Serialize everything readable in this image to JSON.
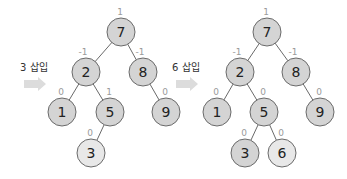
{
  "colors": {
    "node_fill": "#d4d4d4",
    "node_fill_new": "#e8e8e8",
    "node_stroke": "#6a6a6a",
    "edge": "#6a6a6a",
    "bf_text": "#9a9a9a",
    "arrow": "#dcdcdc"
  },
  "panels": [
    {
      "step_label": "3 삽입",
      "nodes": [
        {
          "value": "7",
          "bf": "1",
          "x": 121,
          "y": 32,
          "new": false
        },
        {
          "value": "2",
          "bf": "-1",
          "x": 86,
          "y": 72,
          "new": false
        },
        {
          "value": "8",
          "bf": "-1",
          "x": 143,
          "y": 72,
          "new": false
        },
        {
          "value": "1",
          "bf": "0",
          "x": 62,
          "y": 112,
          "new": false
        },
        {
          "value": "5",
          "bf": "1",
          "x": 110,
          "y": 112,
          "new": false
        },
        {
          "value": "9",
          "bf": "0",
          "x": 166,
          "y": 112,
          "new": false
        },
        {
          "value": "3",
          "bf": "0",
          "x": 91,
          "y": 153,
          "new": true
        }
      ],
      "edges": [
        [
          0,
          1
        ],
        [
          0,
          2
        ],
        [
          1,
          3
        ],
        [
          1,
          4
        ],
        [
          2,
          5
        ],
        [
          4,
          6
        ]
      ]
    },
    {
      "step_label": "6 삽입",
      "nodes": [
        {
          "value": "7",
          "bf": "1",
          "x": 267,
          "y": 32,
          "new": false
        },
        {
          "value": "2",
          "bf": "-1",
          "x": 240,
          "y": 72,
          "new": false
        },
        {
          "value": "8",
          "bf": "-1",
          "x": 296,
          "y": 72,
          "new": false
        },
        {
          "value": "1",
          "bf": "0",
          "x": 217,
          "y": 112,
          "new": false
        },
        {
          "value": "5",
          "bf": "0",
          "x": 264,
          "y": 112,
          "new": false
        },
        {
          "value": "9",
          "bf": "0",
          "x": 320,
          "y": 112,
          "new": false
        },
        {
          "value": "3",
          "bf": "0",
          "x": 245,
          "y": 153,
          "new": false
        },
        {
          "value": "6",
          "bf": "0",
          "x": 282,
          "y": 153,
          "new": true
        }
      ],
      "edges": [
        [
          0,
          1
        ],
        [
          0,
          2
        ],
        [
          1,
          3
        ],
        [
          1,
          4
        ],
        [
          2,
          5
        ],
        [
          4,
          6
        ],
        [
          4,
          7
        ]
      ]
    }
  ],
  "step_positions": [
    {
      "label_x": 20,
      "label_y": 71,
      "arrow_x": 24,
      "arrow_y": 80
    },
    {
      "label_x": 172,
      "label_y": 71,
      "arrow_x": 176,
      "arrow_y": 80
    }
  ]
}
